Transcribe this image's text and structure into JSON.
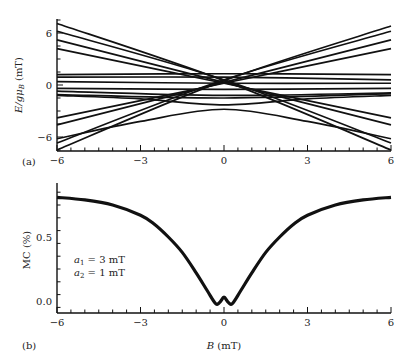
{
  "chart_data": [
    {
      "panel": "(a)",
      "type": "line",
      "title": "",
      "xlabel": "",
      "ylabel": "E/gμB (mT)",
      "xlim": [
        -6,
        6
      ],
      "ylim": [
        -7.8,
        7.7
      ],
      "xticks": [
        -6,
        -3,
        0,
        3,
        6
      ],
      "yticks": [
        -6,
        0,
        6
      ],
      "grid": false,
      "legend": null,
      "series": [
        {
          "name": "rising-1",
          "x": [
            -6,
            0,
            6
          ],
          "values": [
            -3.8,
            0.2,
            4.2
          ]
        },
        {
          "name": "rising-2",
          "x": [
            -6,
            0,
            6
          ],
          "values": [
            -4.6,
            0.3,
            5.2
          ]
        },
        {
          "name": "rising-3",
          "x": [
            -6,
            0,
            6
          ],
          "values": [
            -6.7,
            0.6,
            6.2
          ]
        },
        {
          "name": "rising-4",
          "x": [
            -6,
            0,
            6
          ],
          "values": [
            -7.5,
            0.5,
            6.8
          ]
        },
        {
          "name": "falling-1",
          "x": [
            -6,
            0,
            6
          ],
          "values": [
            4.2,
            0.2,
            -3.8
          ]
        },
        {
          "name": "falling-2",
          "x": [
            -6,
            0,
            6
          ],
          "values": [
            5.2,
            0.3,
            -4.6
          ]
        },
        {
          "name": "falling-3",
          "x": [
            -6,
            0,
            6
          ],
          "values": [
            6.2,
            0.6,
            -6.7
          ]
        },
        {
          "name": "falling-4",
          "x": [
            -6,
            0,
            6
          ],
          "values": [
            7.1,
            0.5,
            -7.5
          ]
        },
        {
          "name": "flat-1",
          "x": [
            -6,
            0,
            6
          ],
          "values": [
            1.2,
            1.3,
            1.2
          ]
        },
        {
          "name": "flat-2",
          "x": [
            -6,
            0,
            6
          ],
          "values": [
            0.9,
            0.9,
            0.6
          ]
        },
        {
          "name": "flat-3",
          "x": [
            -6,
            0,
            6
          ],
          "values": [
            0.4,
            0.2,
            0.2
          ]
        },
        {
          "name": "flat-4",
          "x": [
            -6,
            0,
            6
          ],
          "values": [
            -0.4,
            -0.5,
            -0.4
          ]
        },
        {
          "name": "flat-5",
          "x": [
            -6,
            0,
            6
          ],
          "values": [
            -0.7,
            -1.2,
            -0.9
          ]
        },
        {
          "name": "flat-6",
          "x": [
            -6,
            0,
            6
          ],
          "values": [
            -1.1,
            -1.5,
            -1.0
          ]
        },
        {
          "name": "arch-upper",
          "x": [
            -6,
            -3,
            0,
            3,
            6
          ],
          "values": [
            -1.2,
            -1.6,
            -2.3,
            -1.6,
            -1.2
          ]
        },
        {
          "name": "arch-lower",
          "x": [
            -6,
            -3,
            0,
            3,
            6
          ],
          "values": [
            -6.2,
            -4.2,
            -2.8,
            -4.2,
            -6.2
          ]
        }
      ]
    },
    {
      "panel": "(b)",
      "type": "line",
      "title": "",
      "xlabel": "B (mT)",
      "ylabel": "MC (%)",
      "xlim": [
        -6,
        6
      ],
      "ylim": [
        -0.09,
        0.92
      ],
      "xticks": [
        -6,
        -3,
        0,
        3,
        6
      ],
      "yticks": [
        0.0,
        0.5
      ],
      "grid": false,
      "legend": null,
      "annotations": [
        "a1 = 3 mT",
        "a2 = 1 mT"
      ],
      "series": [
        {
          "name": "MC",
          "x": [
            -6,
            -5,
            -4,
            -3,
            -2.5,
            -2,
            -1.5,
            -1,
            -0.6,
            -0.3,
            -0.15,
            0,
            0.15,
            0.3,
            0.6,
            1,
            1.5,
            2,
            2.5,
            3,
            4,
            5,
            6
          ],
          "values": [
            0.81,
            0.79,
            0.75,
            0.67,
            0.6,
            0.5,
            0.38,
            0.22,
            0.08,
            -0.02,
            -0.01,
            0.03,
            -0.01,
            -0.02,
            0.08,
            0.22,
            0.38,
            0.5,
            0.6,
            0.67,
            0.75,
            0.79,
            0.81
          ]
        }
      ]
    }
  ],
  "labels": {
    "panel_a": "(a)",
    "panel_b": "(b)",
    "ylabel_a_main": "E/gμ",
    "ylabel_a_sub": "B",
    "ylabel_a_unit": " (mT)",
    "ylabel_b": "MC (%)",
    "xlabel_b_var": "B",
    "xlabel_b_unit": " (mT)",
    "annotation_a1_var": "a",
    "annotation_a1_sub": "1",
    "annotation_a1_val": " = 3 mT",
    "annotation_a2_var": "a",
    "annotation_a2_sub": "2",
    "annotation_a2_val": " = 1 mT",
    "xtick_labels": [
      "−6",
      "−3",
      "0",
      "3",
      "6"
    ],
    "ytick_labels_a": [
      "−6",
      "0",
      "6"
    ],
    "ytick_labels_b": [
      "0.0",
      "0.5"
    ]
  },
  "colors": {
    "line": "#111111",
    "axis": "#111111",
    "text": "#222222",
    "background": "#ffffff"
  }
}
